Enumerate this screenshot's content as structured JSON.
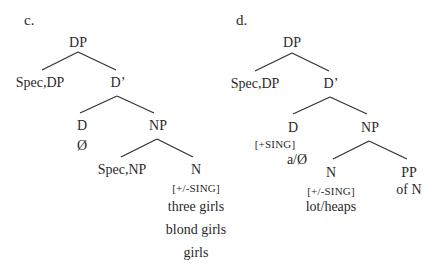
{
  "trees": {
    "c": {
      "tag": "c.",
      "root": "DP",
      "spec_dp": "Spec,DP",
      "d_bar": "D’",
      "d": "D",
      "d_value": "Ø",
      "np": "NP",
      "spec_np": "Spec,NP",
      "n": "N",
      "n_feature": "[+/-SING]",
      "n_examples": [
        "three girls",
        "blond girls",
        "girls"
      ]
    },
    "d": {
      "tag": "d.",
      "root": "DP",
      "spec_dp": "Spec,DP",
      "d_bar": "D’",
      "d": "D",
      "d_feature": "[+SING]",
      "d_value": "a/Ø",
      "np": "NP",
      "n": "N",
      "n_feature": "[+/-SING]",
      "n_value": "lot/heaps",
      "pp": "PP",
      "pp_value": "of N"
    }
  }
}
